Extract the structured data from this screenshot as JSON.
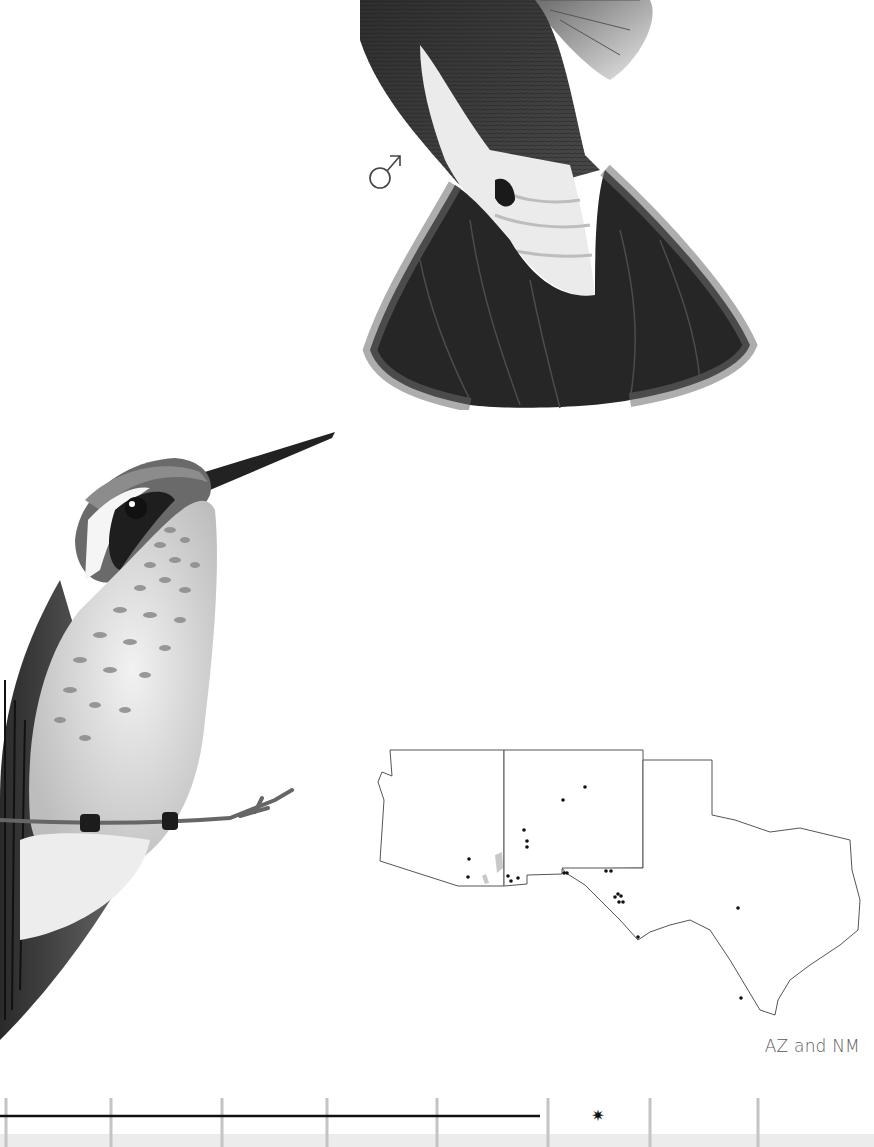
{
  "page": {
    "type": "field-guide-species-plate",
    "background": "#ffffff"
  },
  "illustrations": [
    {
      "id": "male",
      "label": "male hummingbird (tail and underparts, hovering)",
      "sex_symbol": "♂"
    },
    {
      "id": "female",
      "label": "female hummingbird perched on twig",
      "sex_symbol": ""
    }
  ],
  "range_map": {
    "states": [
      "AZ",
      "NM",
      "TX"
    ],
    "caption": "AZ and NM",
    "dot_color": "#111111",
    "outline_color": "#555555",
    "shaded_area_color": "#c8c8c8",
    "dots": [
      [
        585,
        787
      ],
      [
        563,
        800
      ],
      [
        524,
        830
      ],
      [
        527,
        841
      ],
      [
        527,
        847
      ],
      [
        469,
        859
      ],
      [
        468,
        877
      ],
      [
        508,
        876
      ],
      [
        511,
        881
      ],
      [
        518,
        878
      ],
      [
        564,
        873
      ],
      [
        567,
        873
      ],
      [
        606,
        871
      ],
      [
        611,
        871
      ],
      [
        615,
        897
      ],
      [
        618,
        894
      ],
      [
        621,
        896
      ],
      [
        619,
        902
      ],
      [
        623,
        902
      ],
      [
        638,
        937
      ],
      [
        738,
        908
      ],
      [
        741,
        998
      ]
    ]
  },
  "season_bar": {
    "tick_positions": [
      6,
      111,
      222,
      327,
      437,
      548,
      650,
      758
    ],
    "tick_color": "#c4c4c4",
    "line": {
      "x_start": 0,
      "x_end": 540,
      "y": 24,
      "color": "#111111"
    },
    "rare_marker": {
      "symbol": "✷",
      "x": 598
    },
    "shade_color": "#ececec"
  }
}
